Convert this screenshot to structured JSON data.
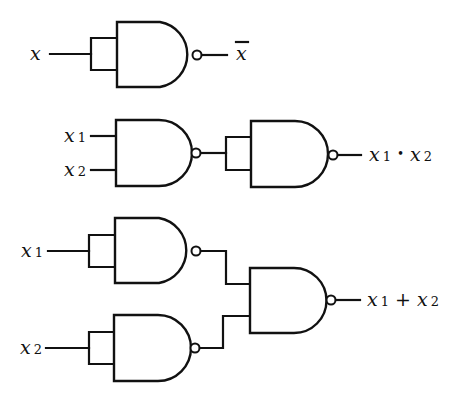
{
  "diagram": {
    "colors": {
      "ink": "#111111",
      "background": "#ffffff"
    },
    "circuits": [
      {
        "name": "not",
        "inputs": [
          {
            "var": "x",
            "sub": ""
          }
        ],
        "output": {
          "var": "x",
          "overline": true,
          "text": "x̄"
        }
      },
      {
        "name": "and",
        "inputs": [
          {
            "var": "x",
            "sub": "1"
          },
          {
            "var": "x",
            "sub": "2"
          }
        ],
        "output": {
          "left_var": "x",
          "left_sub": "1",
          "operator": "•",
          "right_var": "x",
          "right_sub": "2",
          "text": "x₁ • x₂"
        }
      },
      {
        "name": "or",
        "inputs": [
          {
            "var": "x",
            "sub": "1"
          },
          {
            "var": "x",
            "sub": "2"
          }
        ],
        "output": {
          "left_var": "x",
          "left_sub": "1",
          "operator": "+",
          "right_var": "x",
          "right_sub": "2",
          "text": "x₁ + x₂"
        }
      }
    ],
    "gate_type": "NAND",
    "gate_count": 6
  }
}
